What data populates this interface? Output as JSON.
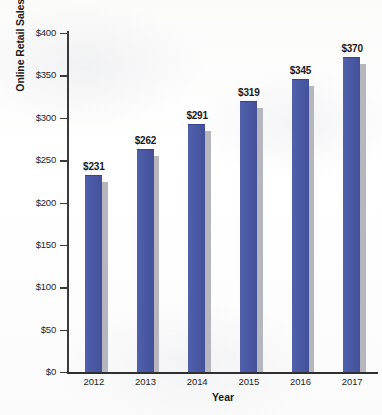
{
  "chart_data": {
    "type": "bar",
    "title": "",
    "xlabel": "Year",
    "ylabel": "Online Retail Sales (in Billions)",
    "categories": [
      "2012",
      "2013",
      "2014",
      "2015",
      "2016",
      "2017"
    ],
    "values": [
      231,
      262,
      291,
      319,
      345,
      370
    ],
    "data_labels": [
      "$231",
      "$262",
      "$291",
      "$319",
      "$345",
      "$370"
    ],
    "ylim": [
      0,
      400
    ],
    "ytick_values": [
      0,
      50,
      100,
      150,
      200,
      250,
      300,
      350,
      400
    ],
    "ytick_labels": [
      "$0",
      "$50",
      "$100",
      "$150",
      "$200",
      "$250",
      "$300",
      "$350",
      "$400"
    ],
    "grid": false,
    "legend": null,
    "series": [
      {
        "name": "Online Retail Sales",
        "values": [
          231,
          262,
          291,
          319,
          345,
          370
        ]
      }
    ],
    "colors": {
      "bar_fill": "#4a59a4",
      "bar_shadow": "#b6b7bd",
      "axis": "#3a3a3a",
      "text": "#1a1a1a",
      "background": "#fdfdfc"
    }
  }
}
